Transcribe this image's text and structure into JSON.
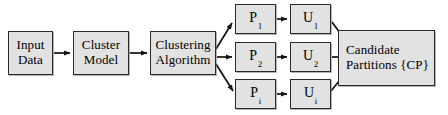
{
  "diagram": {
    "background_color": "#ffffff",
    "node_fill_color": "#e2e2e2",
    "node_border_color": "#2b2b2b",
    "edge_color": "#111111",
    "nodes": {
      "input_data": {
        "line1": "Input",
        "line2": "Data"
      },
      "cluster_model": {
        "line1": "Cluster",
        "line2": "Model"
      },
      "clustering_algorithm": {
        "line1": "Clustering",
        "line2": "Algorithm"
      },
      "p1": {
        "symbol": "P",
        "subscript": "1"
      },
      "u1": {
        "symbol": "U",
        "subscript": "1"
      },
      "p2": {
        "symbol": "P",
        "subscript": "2"
      },
      "u2": {
        "symbol": "U",
        "subscript": "2"
      },
      "pi": {
        "symbol": "P",
        "subscript": "i"
      },
      "ui": {
        "symbol": "U",
        "subscript": "i"
      },
      "candidate_partitions": {
        "line1": "Candidate",
        "line2": "Partitions {CP}"
      }
    },
    "edges": [
      {
        "id": "input-to-cluster-model",
        "from": "input_data",
        "to": "cluster_model",
        "style": "straight-arrow"
      },
      {
        "id": "cluster-model-to-algorithm",
        "from": "cluster_model",
        "to": "clustering_algorithm",
        "style": "straight-arrow"
      },
      {
        "id": "algorithm-to-p1",
        "from": "clustering_algorithm",
        "to": "p1",
        "style": "diagonal-up-arrow"
      },
      {
        "id": "algorithm-to-p2",
        "from": "clustering_algorithm",
        "to": "p2",
        "style": "straight-arrow"
      },
      {
        "id": "algorithm-to-pi",
        "from": "clustering_algorithm",
        "to": "pi",
        "style": "diagonal-down-arrow"
      },
      {
        "id": "p1-to-u1",
        "from": "p1",
        "to": "u1",
        "style": "straight-arrow"
      },
      {
        "id": "p2-to-u2",
        "from": "p2",
        "to": "u2",
        "style": "straight-arrow"
      },
      {
        "id": "pi-to-ui",
        "from": "pi",
        "to": "ui",
        "style": "straight-arrow"
      },
      {
        "id": "u1-to-candidate-partitions",
        "from": "u1",
        "to": "candidate_partitions",
        "style": "diagonal-down-arrow"
      },
      {
        "id": "u2-to-candidate-partitions",
        "from": "u2",
        "to": "candidate_partitions",
        "style": "straight-arrow"
      },
      {
        "id": "ui-to-candidate-partitions",
        "from": "ui",
        "to": "candidate_partitions",
        "style": "diagonal-up-arrow"
      }
    ]
  }
}
